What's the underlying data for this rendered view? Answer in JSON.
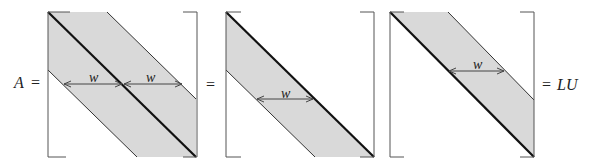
{
  "equation": {
    "lhs_label": "A",
    "equals_1": "=",
    "equals_2": "=",
    "equals_3": "=",
    "rhs_label": "LU"
  },
  "matrices": [
    {
      "name": "A",
      "band_label_left": "w",
      "band_label_right": "w",
      "description": "banded matrix with bandwidth w on each side of diagonal"
    },
    {
      "name": "L",
      "band_label": "w",
      "description": "lower triangular band"
    },
    {
      "name": "U",
      "band_label": "w",
      "description": "upper triangular band"
    }
  ],
  "colors": {
    "band_fill": "#d9d9d9",
    "diagonal": "#111111",
    "edges": "#333333",
    "bracket": "#555555"
  }
}
